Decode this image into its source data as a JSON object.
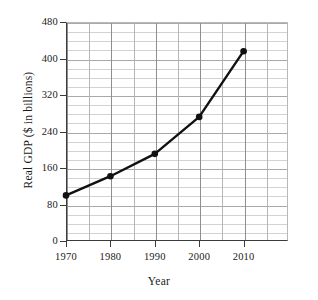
{
  "chart_data": {
    "type": "line",
    "title": "",
    "xlabel": "Year",
    "ylabel": "Real GDP ($ in billions)",
    "x": [
      1970,
      1980,
      1990,
      2000,
      2010
    ],
    "values": [
      100,
      142,
      191,
      272,
      416
    ],
    "series": [
      {
        "name": "Real GDP",
        "values": [
          100,
          142,
          191,
          272,
          416
        ]
      }
    ],
    "xlim": [
      1970,
      2020
    ],
    "ylim": [
      0,
      480
    ],
    "y_ticks": [
      0,
      80,
      160,
      240,
      320,
      400,
      480
    ],
    "y_tick_labels": [
      "0",
      "80",
      "160",
      "240",
      "320",
      "400",
      "480"
    ],
    "x_ticks": [
      1970,
      1980,
      1990,
      2000,
      2010
    ],
    "x_tick_labels": [
      "1970",
      "1980",
      "1990",
      "2000",
      "2010"
    ],
    "y_minor_step": 20,
    "x_minor_step": 5,
    "grid": true,
    "legend": "none",
    "marker": "filled-circle",
    "line_color": "#111111",
    "grid_color": "#d2d2d2",
    "axis_color": "#3a3a3a"
  },
  "axes": {
    "x_title": "Year",
    "y_title": "Real GDP ($ in billions)"
  }
}
